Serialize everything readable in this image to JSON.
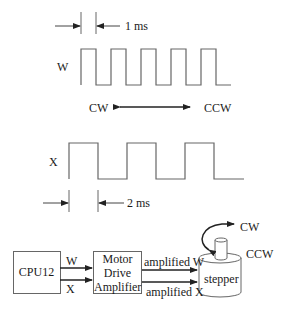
{
  "timing": {
    "w_period_label": "1 ms",
    "x_period_label": "2 ms",
    "w_signal_label": "W",
    "x_signal_label": "X",
    "direction_left": "CW",
    "direction_right": "CCW"
  },
  "block_diagram": {
    "cpu_label": "CPU12",
    "signal_w": "W",
    "signal_x": "X",
    "amp_line1": "Motor",
    "amp_line2": "Drive",
    "amp_line3": "Amplifier",
    "amplified_w": "amplified W",
    "amplified_x": "amplified X",
    "motor_label": "stepper",
    "rotation_cw": "CW",
    "rotation_ccw": "CCW"
  },
  "colors": {
    "line": "#555555",
    "text": "#1a1a1a",
    "background": "#ffffff"
  }
}
